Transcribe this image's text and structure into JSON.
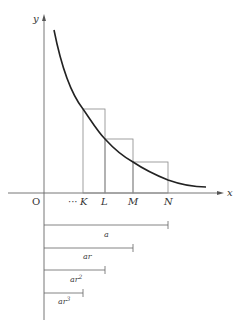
{
  "diagram": {
    "type": "geometric series area under decreasing curve",
    "axes": {
      "x_label": "x",
      "y_label": "y",
      "origin_label": "O"
    },
    "points": {
      "ellipsis": "···",
      "K": "K",
      "L": "L",
      "M": "M",
      "N": "N"
    },
    "segments": [
      {
        "label": "a",
        "from": "O",
        "to": "N"
      },
      {
        "label": "ar",
        "from": "O",
        "to": "M"
      },
      {
        "label": "ar²",
        "from": "O",
        "to": "L"
      },
      {
        "label": "ar³",
        "from": "O",
        "to": "K"
      }
    ],
    "segment_labels": {
      "a": "a",
      "ar": "ar",
      "ar2_base": "ar",
      "ar2_exp": "2",
      "ar3_base": "ar",
      "ar3_exp": "3"
    },
    "colors": {
      "curve": "#222222",
      "axes": "#555555",
      "rectangles": "#888888",
      "segments": "#666666"
    }
  }
}
